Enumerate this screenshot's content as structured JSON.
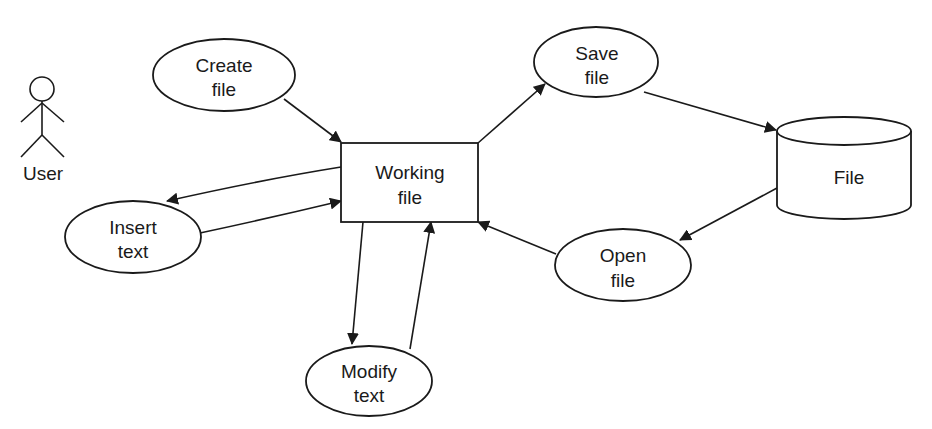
{
  "diagram": {
    "type": "data-flow / use-case diagram",
    "actor": {
      "label": "User",
      "icon": "stick-figure-icon"
    },
    "nodes": {
      "create_file": {
        "line1": "Create",
        "line2": "file",
        "shape": "ellipse"
      },
      "insert_text": {
        "line1": "Insert",
        "line2": "text",
        "shape": "ellipse"
      },
      "working_file": {
        "line1": "Working",
        "line2": "file",
        "shape": "rectangle"
      },
      "modify_text": {
        "line1": "Modify",
        "line2": "text",
        "shape": "ellipse"
      },
      "save_file": {
        "line1": "Save",
        "line2": "file",
        "shape": "ellipse"
      },
      "open_file": {
        "line1": "Open",
        "line2": "file",
        "shape": "ellipse"
      },
      "file_store": {
        "label": "File",
        "shape": "cylinder"
      }
    },
    "edges": [
      {
        "from": "Create file",
        "to": "Working file"
      },
      {
        "from": "Working file",
        "to": "Insert text"
      },
      {
        "from": "Insert text",
        "to": "Working file"
      },
      {
        "from": "Working file",
        "to": "Modify text"
      },
      {
        "from": "Modify text",
        "to": "Working file"
      },
      {
        "from": "Working file",
        "to": "Save file"
      },
      {
        "from": "Save file",
        "to": "File"
      },
      {
        "from": "File",
        "to": "Open file"
      },
      {
        "from": "Open file",
        "to": "Working file"
      }
    ],
    "colors": {
      "stroke": "#1a1a1a",
      "background": "#ffffff"
    }
  }
}
